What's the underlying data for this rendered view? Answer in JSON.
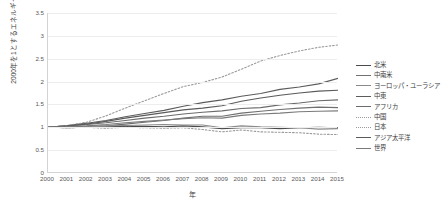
{
  "chart_data": {
    "type": "line",
    "title": "",
    "xlabel": "年",
    "ylabel": "2000年を1とするエネルギー消費量",
    "x": [
      2000,
      2001,
      2002,
      2003,
      2004,
      2005,
      2006,
      2007,
      2008,
      2009,
      2010,
      2011,
      2012,
      2013,
      2014,
      2015
    ],
    "xlim": [
      2000,
      2015
    ],
    "ylim": [
      0,
      3.5
    ],
    "yticks": [
      "0",
      "0.5",
      "1",
      "1.5",
      "2",
      "2.5",
      "3",
      "3.5"
    ],
    "grid": true,
    "legend_position": "right",
    "series": [
      {
        "name": "北米",
        "color": "#4a4a4a",
        "style": "solid",
        "values": [
          1.0,
          0.99,
          1.0,
          1.01,
          1.02,
          1.02,
          1.01,
          1.03,
          1.01,
          0.97,
          0.99,
          0.99,
          0.97,
          0.99,
          1.0,
          0.99
        ]
      },
      {
        "name": "中南米",
        "color": "#707070",
        "style": "solid",
        "values": [
          1.0,
          1.01,
          1.02,
          1.03,
          1.07,
          1.11,
          1.15,
          1.2,
          1.24,
          1.24,
          1.31,
          1.35,
          1.39,
          1.42,
          1.44,
          1.43
        ]
      },
      {
        "name": "ヨーロッパ・ユーラシア",
        "color": "#8a8a8a",
        "style": "solid",
        "values": [
          1.0,
          1.01,
          1.01,
          1.03,
          1.04,
          1.05,
          1.06,
          1.05,
          1.05,
          0.99,
          1.03,
          1.01,
          1.0,
          0.99,
          0.96,
          0.97
        ]
      },
      {
        "name": "中東",
        "color": "#5c5c5c",
        "style": "solid",
        "values": [
          1.0,
          1.04,
          1.09,
          1.15,
          1.23,
          1.3,
          1.37,
          1.46,
          1.54,
          1.6,
          1.68,
          1.74,
          1.83,
          1.88,
          1.95,
          2.07
        ]
      },
      {
        "name": "アフリカ",
        "color": "#6b6b6b",
        "style": "solid",
        "values": [
          1.0,
          1.03,
          1.06,
          1.1,
          1.15,
          1.2,
          1.24,
          1.29,
          1.33,
          1.36,
          1.41,
          1.43,
          1.49,
          1.53,
          1.58,
          1.6
        ]
      },
      {
        "name": "中国",
        "color": "#9a9a9a",
        "style": "dotted",
        "values": [
          1.0,
          1.04,
          1.11,
          1.25,
          1.42,
          1.58,
          1.74,
          1.89,
          1.98,
          2.1,
          2.27,
          2.45,
          2.57,
          2.67,
          2.75,
          2.8
        ]
      },
      {
        "name": "日本",
        "color": "#9a9a9a",
        "style": "dotted",
        "values": [
          1.0,
          0.99,
          1.0,
          0.98,
          1.0,
          0.99,
          0.98,
          0.99,
          0.95,
          0.9,
          0.94,
          0.9,
          0.89,
          0.88,
          0.85,
          0.84
        ]
      },
      {
        "name": "アジア太平洋",
        "color": "#5a5a5a",
        "style": "solid",
        "values": [
          1.0,
          1.03,
          1.07,
          1.13,
          1.2,
          1.26,
          1.32,
          1.38,
          1.42,
          1.47,
          1.57,
          1.64,
          1.7,
          1.75,
          1.79,
          1.81
        ]
      },
      {
        "name": "世界",
        "color": "#7a7a7a",
        "style": "solid",
        "values": [
          1.0,
          1.01,
          1.03,
          1.06,
          1.1,
          1.13,
          1.16,
          1.19,
          1.21,
          1.2,
          1.26,
          1.29,
          1.31,
          1.34,
          1.35,
          1.36
        ]
      }
    ]
  },
  "legend": {
    "items": [
      {
        "label": "北米"
      },
      {
        "label": "中南米"
      },
      {
        "label": "ヨーロッパ・ユーラシア"
      },
      {
        "label": "中東"
      },
      {
        "label": "アフリカ"
      },
      {
        "label": "中国"
      },
      {
        "label": "日本"
      },
      {
        "label": "アジア太平洋"
      },
      {
        "label": "世界"
      }
    ]
  }
}
